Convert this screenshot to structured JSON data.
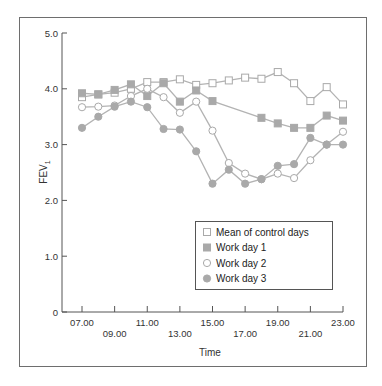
{
  "colors": {
    "frame": "#6e6e6e",
    "axis": "#555555",
    "series_line": "#b3b3b3",
    "marker_fill": "#a9a9a9",
    "marker_stroke": "#a9a9a9",
    "open_fill": "#ffffff"
  },
  "chart_data": {
    "type": "line",
    "title": "",
    "xlabel": "Time",
    "ylabel": "FEV1",
    "ylabel_main": "FEV",
    "ylabel_sub": "1",
    "ylim": [
      0,
      5.0
    ],
    "yticks": [
      0,
      1.0,
      2.0,
      3.0,
      4.0,
      5.0
    ],
    "ytick_labels": [
      "0",
      "1.0",
      "2.0",
      "3.0",
      "4.0",
      "5.0"
    ],
    "xlim": [
      7,
      23
    ],
    "xticks": [
      7,
      9,
      11,
      13,
      15,
      17,
      19,
      21,
      23
    ],
    "xtick_labels": [
      "07.00",
      "09.00",
      "11.00",
      "13.00",
      "15.00",
      "17.00",
      "19.00",
      "21.00",
      "23.00"
    ],
    "grid": false,
    "legend_position": "lower right (inside plot)",
    "x": [
      7,
      8,
      9,
      10,
      11,
      12,
      13,
      14,
      15,
      16,
      17,
      18,
      19,
      20,
      21,
      22,
      23
    ],
    "series": [
      {
        "name": "Mean of control days",
        "marker": "square-open",
        "x": [
          7,
          8,
          9,
          10,
          11,
          12,
          13,
          14,
          15,
          16,
          17,
          18,
          19,
          20,
          21,
          22,
          23
        ],
        "values": [
          3.85,
          3.9,
          3.93,
          4.0,
          4.12,
          4.12,
          4.17,
          4.07,
          4.1,
          4.15,
          4.2,
          4.18,
          4.3,
          4.1,
          3.78,
          4.03,
          3.72
        ]
      },
      {
        "name": "Work day 1",
        "marker": "square-filled",
        "x": [
          7,
          8,
          9,
          10,
          11,
          12,
          13,
          14,
          15,
          18,
          19,
          20,
          21,
          22,
          23
        ],
        "values": [
          3.92,
          3.9,
          3.98,
          4.08,
          3.87,
          4.1,
          3.77,
          3.97,
          3.78,
          3.48,
          3.38,
          3.3,
          3.3,
          3.52,
          3.43
        ]
      },
      {
        "name": "Work day 2",
        "marker": "circle-open",
        "x": [
          7,
          8,
          9,
          10,
          11,
          12,
          13,
          14,
          15,
          16,
          17,
          18,
          19,
          20,
          21,
          22,
          23
        ],
        "values": [
          3.67,
          3.68,
          3.7,
          3.87,
          4.0,
          3.85,
          3.57,
          3.77,
          3.25,
          2.67,
          2.48,
          2.38,
          2.48,
          2.4,
          2.72,
          3.0,
          3.23
        ]
      },
      {
        "name": "Work day 3",
        "marker": "circle-filled",
        "x": [
          7,
          8,
          9,
          10,
          11,
          12,
          13,
          14,
          15,
          16,
          17,
          18,
          19,
          20,
          21,
          22,
          23
        ],
        "values": [
          3.3,
          3.5,
          3.68,
          3.77,
          3.67,
          3.28,
          3.27,
          2.88,
          2.3,
          2.55,
          2.3,
          2.38,
          2.62,
          2.65,
          3.12,
          3.0,
          3.0
        ]
      }
    ]
  }
}
